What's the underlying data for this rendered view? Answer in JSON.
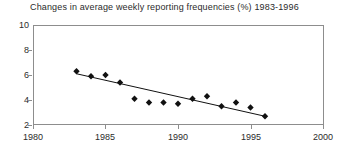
{
  "chart_data": {
    "type": "scatter",
    "title": "Changes in average weekly reporting frequencies (%) 1983-1996",
    "xlabel": "",
    "ylabel": "",
    "xlim": [
      1980,
      2000
    ],
    "ylim": [
      2,
      10
    ],
    "xticks": [
      1980,
      1985,
      1990,
      1995,
      2000
    ],
    "yticks": [
      2,
      4,
      6,
      8,
      10
    ],
    "grid": false,
    "legend": null,
    "x": [
      1983,
      1984,
      1985,
      1986,
      1987,
      1988,
      1989,
      1990,
      1991,
      1992,
      1993,
      1994,
      1995,
      1996
    ],
    "series": [
      {
        "name": "Average weekly reporting frequency",
        "marker": "diamond",
        "color": "#111111",
        "values": [
          6.3,
          5.9,
          6.0,
          5.4,
          4.1,
          3.8,
          3.8,
          3.7,
          4.1,
          4.3,
          3.5,
          3.8,
          3.4,
          2.7
        ]
      }
    ],
    "trendline": {
      "name": "linear-fit",
      "color": "#111111",
      "x_start": 1983,
      "y_start": 6.1,
      "x_end": 1996,
      "y_end": 2.7
    }
  },
  "axes": {
    "y_tick_labels": [
      "10",
      "8",
      "6",
      "4",
      "2"
    ],
    "x_tick_labels": [
      "1980",
      "1985",
      "1990",
      "1995",
      "2000"
    ]
  }
}
